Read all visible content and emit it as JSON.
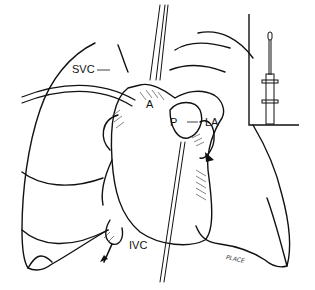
{
  "figure": {
    "type": "anatomical illustration"
  },
  "labels": {
    "svc": "SVC",
    "aorta": "A",
    "pulmonary": "P",
    "la": "LA",
    "ivc": "IVC"
  },
  "signature": "PLACE",
  "colors": {
    "line": "#111111",
    "background": "#ffffff"
  }
}
